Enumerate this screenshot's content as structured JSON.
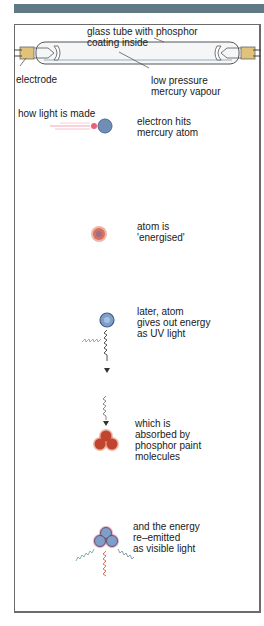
{
  "header": {
    "bar_color": "#5f7a85"
  },
  "tube": {
    "labels": {
      "glass": "glass tube with phosphor\ncoating inside",
      "electrode": "electrode",
      "vapour": "low pressure\nmercury vapour"
    }
  },
  "process": {
    "title": "how light is made",
    "steps": [
      {
        "label": "electron hits\nmercury atom",
        "icon": "electron-atom-collision"
      },
      {
        "label": "atom is\n'energised'",
        "icon": "energised-atom"
      },
      {
        "label": "later, atom\ngives out energy\nas UV light",
        "icon": "atom-emitting-uv"
      },
      {
        "label": "which is\nabsorbed by\nphosphor paint\nmolecules",
        "icon": "phosphor-molecule-absorbing"
      },
      {
        "label": "and the energy\nre–emitted\nas visible light",
        "icon": "molecule-emitting-visible-light"
      }
    ]
  },
  "colors": {
    "atom_blue": "#6f8db5",
    "electron_red": "#e8607a",
    "energised_red": "#d9705a",
    "phosphor_red": "#c0442e",
    "electrode_gold": "#e0c27a",
    "wave_green": "#7fb89a",
    "wave_red": "#e0705a",
    "wave_gray": "#8a9aa8"
  }
}
